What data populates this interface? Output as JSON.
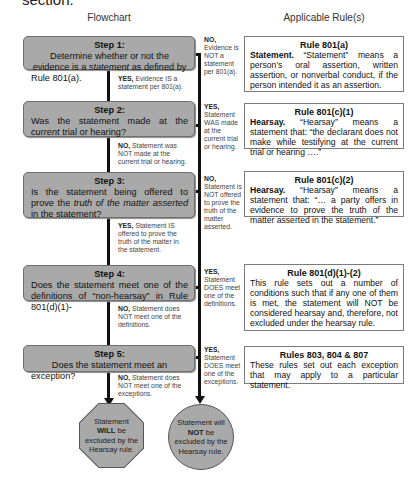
{
  "page": {
    "cut_off_heading": "section."
  },
  "columns": {
    "flowchart": "Flowchart",
    "rules": "Applicable Rule(s)"
  },
  "steps": [
    {
      "title": "Step 1:",
      "q_pre": "Determine whether or not the evidence is a ",
      "q_em": "statement",
      "q_post": " as defined by Rule 801(a)."
    },
    {
      "title": "Step 2:",
      "q_pre": "Was the statement made at the ",
      "q_em": "current",
      "q_post": " trial or hearing?"
    },
    {
      "title": "Step 3:",
      "q_pre": "Is the statement being offered to prove the ",
      "q_em": "truth of the matter asserted",
      "q_post": " in the statement?"
    },
    {
      "title": "Step 4:",
      "q_pre": "Does the statement meet one of the definitions of “non-hearsay” in Rule 801(d)(1)-",
      "q_em": "",
      "q_post": ""
    },
    {
      "title": "Step 5:",
      "q_pre": "Does the statement meet an exception?",
      "q_em": "",
      "q_post": ""
    }
  ],
  "down_labels": [
    {
      "key": "YES,",
      "text": " Evidence IS a statement per 801(a)."
    },
    {
      "key": "NO,",
      "text": " Statement was NOT made at the current trial or hearing."
    },
    {
      "key": "YES,",
      "text": " Statement IS offered to prove the truth of the matter in the statement."
    },
    {
      "key": "NO,",
      "text": " Statement does NOT meet one of the definitions."
    },
    {
      "key": "NO,",
      "text": " Statement does NOT meet one of the exceptions."
    }
  ],
  "side_labels": [
    {
      "key": "NO,",
      "text": "Evidence is NOT a statement per 801(a)."
    },
    {
      "key": "YES,",
      "text": "Statement WAS made at the current trial or hearing."
    },
    {
      "key": "NO,",
      "text": "Statement is NOT offered to prove the truth of the matter asserted."
    },
    {
      "key": "YES,",
      "text": "Statement DOES meet one of the definitions."
    },
    {
      "key": "YES,",
      "text": "Statement DOES meet one of the exceptions."
    }
  ],
  "rules": [
    {
      "title": "Rule 801(a)",
      "lead": "Statement.",
      "body": " “Statement” means a person’s oral assertion, written assertion, or nonverbal conduct, if the person intended it as an assertion."
    },
    {
      "title": "Rule 801(c)(1)",
      "lead": "Hearsay.",
      "body": " “Hearsay” means a statement that: “the declarant does not make while testifying at the current trial or hearing ….”"
    },
    {
      "title": "Rule 801(c)(2)",
      "lead": "Hearsay.",
      "body": " “Hearsay” means a statement that: “… a party offers in evidence to prove the truth of the matter asserted in the statement.”"
    },
    {
      "title": "Rule 801(d)(1)-(2)",
      "lead": "",
      "body": "This rule sets out a number of conditions such that if any one of them is met, the statement will NOT be considered hearsay and, therefore, not excluded under the hearsay rule."
    },
    {
      "title": "Rules 803, 804 & 807",
      "lead": "",
      "body": "These rules set out each exception that may apply to a particular statement."
    }
  ],
  "terminals": {
    "excluded": {
      "pre": "Statement ",
      "strong": "WILL",
      "post": " be excluded by the Hearsay rule."
    },
    "not_excluded": {
      "pre": "Statement will ",
      "strong": "NOT",
      "post": " be excluded by the Hearsay rule."
    }
  },
  "colors": {
    "step_fill": "#a9a9a9",
    "line": "#111111",
    "rule_border": "#7a7a7a"
  }
}
